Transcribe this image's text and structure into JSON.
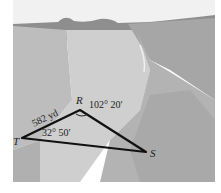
{
  "figure": {
    "vertices": {
      "T": {
        "label": "T"
      },
      "R": {
        "label": "R"
      },
      "S": {
        "label": "S"
      }
    },
    "side_TR": {
      "label": "582 yd"
    },
    "angle_R": {
      "label": "102° 20′"
    },
    "angle_T": {
      "label": "32° 50′"
    }
  }
}
